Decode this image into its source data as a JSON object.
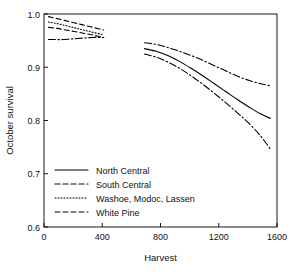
{
  "chart_data": {
    "type": "line",
    "title": "",
    "xlabel": "Harvest",
    "ylabel": "October survival",
    "xlim": [
      0,
      1600
    ],
    "ylim": [
      0.6,
      1.0
    ],
    "xticks": [
      0,
      400,
      800,
      1200,
      1600
    ],
    "xtick_labels": [
      "0",
      "400",
      "800",
      "1200",
      "1600"
    ],
    "yticks": [
      0.6,
      0.7,
      0.8,
      0.9,
      1.0
    ],
    "ytick_labels": [
      "0.6",
      "0.7",
      "0.8",
      "0.9",
      "1.0"
    ],
    "grid": false,
    "legend_position": "lower-left-inside",
    "series": [
      {
        "name": "North Central",
        "linestyle": "solid",
        "x": [
          690,
          770,
          850,
          930,
          1010,
          1090,
          1170,
          1250,
          1330,
          1410,
          1490,
          1555
        ],
        "y": [
          0.935,
          0.93,
          0.922,
          0.911,
          0.898,
          0.884,
          0.869,
          0.854,
          0.839,
          0.825,
          0.812,
          0.804
        ]
      },
      {
        "name": "South Central",
        "linestyle": "dashed",
        "x": [
          30,
          80,
          140,
          200,
          260,
          320,
          380,
          410
        ],
        "y": [
          0.995,
          0.992,
          0.988,
          0.984,
          0.98,
          0.976,
          0.972,
          0.97
        ]
      },
      {
        "name": "Washoe, Modoc, Lassen",
        "linestyle": "dotted",
        "x": [
          30,
          90,
          150,
          210,
          270,
          330,
          390,
          410
        ],
        "y": [
          0.985,
          0.982,
          0.978,
          0.974,
          0.97,
          0.966,
          0.962,
          0.961
        ]
      },
      {
        "name": "White Pine",
        "linestyle": "dashdot",
        "x": [
          690,
          770,
          850,
          930,
          1010,
          1090,
          1170,
          1250,
          1330,
          1410,
          1490,
          1555
        ],
        "y": [
          0.925,
          0.919,
          0.91,
          0.898,
          0.884,
          0.868,
          0.851,
          0.833,
          0.814,
          0.794,
          0.77,
          0.746
        ]
      },
      {
        "name": "North Central (upper band)",
        "linestyle": "dashdot",
        "x": [
          690,
          770,
          850,
          930,
          1010,
          1090,
          1170,
          1250,
          1330,
          1410,
          1490,
          1555
        ],
        "y": [
          0.946,
          0.943,
          0.937,
          0.93,
          0.922,
          0.913,
          0.903,
          0.893,
          0.883,
          0.875,
          0.869,
          0.865
        ]
      },
      {
        "name": "Left cluster upper",
        "linestyle": "dashed",
        "x": [
          30,
          90,
          150,
          210,
          270,
          330,
          390,
          410
        ],
        "y": [
          0.975,
          0.973,
          0.97,
          0.967,
          0.964,
          0.961,
          0.957,
          0.956
        ]
      },
      {
        "name": "Left cluster lower",
        "linestyle": "dashdot",
        "x": [
          30,
          80,
          130,
          180,
          230,
          280,
          330,
          380,
          410
        ],
        "y": [
          0.952,
          0.952,
          0.952,
          0.953,
          0.954,
          0.955,
          0.956,
          0.956,
          0.956
        ]
      }
    ],
    "legend_entries": [
      {
        "label": "North Central",
        "linestyle": "solid"
      },
      {
        "label": "South Central",
        "linestyle": "dashed"
      },
      {
        "label": "Washoe, Modoc, Lassen",
        "linestyle": "dotted"
      },
      {
        "label": "White Pine",
        "linestyle": "dashdot"
      }
    ]
  }
}
